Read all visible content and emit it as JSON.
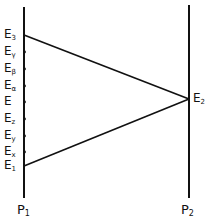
{
  "diagram": {
    "type": "energy-level-transfer",
    "colors": {
      "line": "#111111",
      "background": "#ffffff"
    },
    "lines": {
      "left": {
        "label": "P",
        "subscript": "1",
        "x": 24,
        "y_top": 7,
        "y_bottom": 198
      },
      "right": {
        "label": "P",
        "subscript": "2",
        "x": 189,
        "y_top": 5,
        "y_bottom": 198
      }
    },
    "left_levels": [
      {
        "id": "E3",
        "base": "E",
        "sub": "3",
        "y": 35,
        "tick": false
      },
      {
        "id": "Egamma",
        "base": "E",
        "sub": "γ",
        "y": 52,
        "tick": true
      },
      {
        "id": "Ebeta",
        "base": "E",
        "sub": "β",
        "y": 69,
        "tick": true
      },
      {
        "id": "Ealpha",
        "base": "E",
        "sub": "α",
        "y": 86,
        "tick": true
      },
      {
        "id": "E",
        "base": "E",
        "sub": "",
        "y": 102,
        "tick": true
      },
      {
        "id": "Ez",
        "base": "E",
        "sub": "z",
        "y": 119,
        "tick": true
      },
      {
        "id": "Ey",
        "base": "E",
        "sub": "y",
        "y": 136,
        "tick": true
      },
      {
        "id": "Ex",
        "base": "E",
        "sub": "x",
        "y": 152,
        "tick": true
      },
      {
        "id": "E1",
        "base": "E",
        "sub": "1",
        "y": 166,
        "tick": false
      }
    ],
    "right_levels": [
      {
        "id": "E2",
        "base": "E",
        "sub": "2",
        "y": 99
      }
    ],
    "connections": [
      {
        "from": "E3",
        "to": "E2"
      },
      {
        "from": "E1",
        "to": "E2"
      }
    ]
  }
}
